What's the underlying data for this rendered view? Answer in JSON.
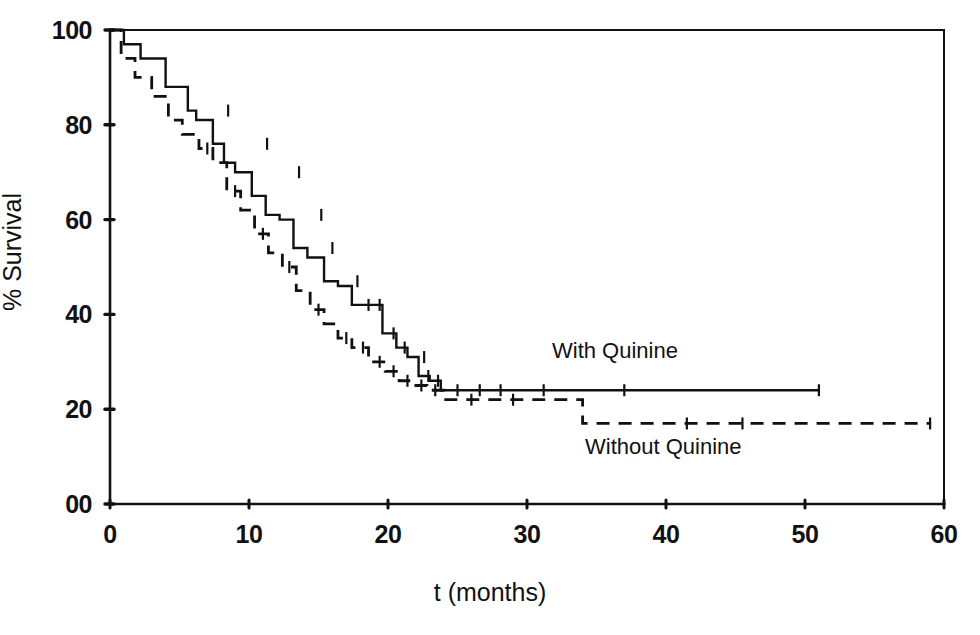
{
  "figure": {
    "background_color": "#ffffff",
    "ink_color": "#111111"
  },
  "chart_data": {
    "type": "line",
    "subtype": "kaplan-meier-survival-step",
    "title": "",
    "xlabel": "t (months)",
    "ylabel": "% Survival",
    "xlim": [
      0,
      60
    ],
    "ylim": [
      0,
      100
    ],
    "grid": false,
    "legend_position": "inline-annotation",
    "x_ticks": [
      0,
      10,
      20,
      30,
      40,
      50,
      60
    ],
    "x_tick_labels": [
      "0",
      "10",
      "20",
      "30",
      "40",
      "50",
      "60"
    ],
    "y_ticks": [
      0,
      20,
      40,
      60,
      80,
      100
    ],
    "y_tick_labels": [
      "00",
      "20",
      "40",
      "60",
      "80",
      "100"
    ],
    "series": [
      {
        "name": "With Quinine",
        "line_style": "solid",
        "label_text": "With Quinine",
        "x": [
          0,
          1.0,
          1.0,
          2.2,
          2.2,
          4.0,
          4.0,
          5.6,
          5.6,
          6.2,
          6.2,
          7.4,
          7.4,
          8.2,
          8.2,
          9.0,
          9.0,
          10.2,
          10.2,
          11.2,
          11.2,
          12.2,
          12.2,
          13.2,
          13.2,
          14.2,
          14.2,
          15.4,
          15.4,
          16.4,
          16.4,
          17.4,
          17.4,
          18.6,
          18.6,
          19.6,
          19.6,
          20.6,
          20.6,
          21.4,
          21.4,
          22.2,
          22.2,
          23.0,
          23.0,
          23.8,
          23.8,
          51.0
        ],
        "y": [
          100,
          100,
          97,
          97,
          94,
          94,
          88,
          88,
          83,
          83,
          81,
          81,
          76,
          76,
          72,
          72,
          70,
          70,
          65,
          65,
          61,
          61,
          60,
          60,
          54,
          54,
          52,
          52,
          47,
          47,
          46,
          46,
          42,
          42,
          42,
          42,
          36,
          36,
          33,
          33,
          31,
          31,
          27,
          27,
          26,
          26,
          24,
          24
        ],
        "censor_marks": [
          {
            "x": 8.5,
            "y": 83
          },
          {
            "x": 11.3,
            "y": 76
          },
          {
            "x": 13.6,
            "y": 70
          },
          {
            "x": 15.2,
            "y": 61
          },
          {
            "x": 16.0,
            "y": 54
          },
          {
            "x": 17.8,
            "y": 47
          },
          {
            "x": 18.6,
            "y": 42
          },
          {
            "x": 19.4,
            "y": 42
          },
          {
            "x": 20.4,
            "y": 36
          },
          {
            "x": 21.2,
            "y": 33
          },
          {
            "x": 22.6,
            "y": 31
          },
          {
            "x": 22.9,
            "y": 27
          },
          {
            "x": 23.6,
            "y": 26
          },
          {
            "x": 25.0,
            "y": 24
          },
          {
            "x": 26.6,
            "y": 24
          },
          {
            "x": 28.1,
            "y": 24
          },
          {
            "x": 31.2,
            "y": 24
          },
          {
            "x": 37.0,
            "y": 24
          },
          {
            "x": 51.0,
            "y": 24
          }
        ],
        "plateau_value": 24,
        "end_x": 51.0
      },
      {
        "name": "Without Quinine",
        "line_style": "dashed",
        "label_text": "Without Quinine",
        "x": [
          0,
          0.8,
          0.8,
          1.8,
          1.8,
          3.0,
          3.0,
          4.2,
          4.2,
          5.2,
          5.2,
          6.4,
          6.4,
          7.4,
          7.4,
          8.4,
          8.4,
          9.4,
          9.4,
          10.4,
          10.4,
          11.4,
          11.4,
          12.4,
          12.4,
          13.4,
          13.4,
          14.4,
          14.4,
          15.4,
          15.4,
          16.4,
          16.4,
          17.4,
          17.4,
          18.6,
          18.6,
          19.8,
          19.8,
          20.8,
          20.8,
          21.8,
          21.8,
          22.8,
          22.8,
          24.0,
          24.0,
          34.0,
          34.0,
          59.0
        ],
        "y": [
          100,
          100,
          94,
          94,
          90,
          90,
          86,
          86,
          81,
          81,
          78,
          78,
          75,
          75,
          72,
          72,
          66,
          66,
          62,
          62,
          57,
          57,
          53,
          53,
          50,
          50,
          45,
          45,
          41,
          41,
          38,
          38,
          35,
          35,
          33,
          33,
          30,
          30,
          28,
          28,
          26,
          26,
          25,
          25,
          24,
          24,
          22,
          22,
          17,
          17
        ],
        "censor_marks": [
          {
            "x": 7.0,
            "y": 75
          },
          {
            "x": 9.0,
            "y": 66
          },
          {
            "x": 11.0,
            "y": 57
          },
          {
            "x": 12.9,
            "y": 50
          },
          {
            "x": 15.0,
            "y": 41
          },
          {
            "x": 17.0,
            "y": 35
          },
          {
            "x": 18.2,
            "y": 33
          },
          {
            "x": 19.4,
            "y": 30
          },
          {
            "x": 20.4,
            "y": 28
          },
          {
            "x": 21.4,
            "y": 26
          },
          {
            "x": 22.4,
            "y": 25
          },
          {
            "x": 23.4,
            "y": 24
          },
          {
            "x": 26.0,
            "y": 22
          },
          {
            "x": 29.0,
            "y": 22
          },
          {
            "x": 41.5,
            "y": 17
          },
          {
            "x": 45.5,
            "y": 17
          },
          {
            "x": 59.0,
            "y": 17
          }
        ],
        "plateau_value": 17,
        "end_x": 59.0
      }
    ]
  }
}
